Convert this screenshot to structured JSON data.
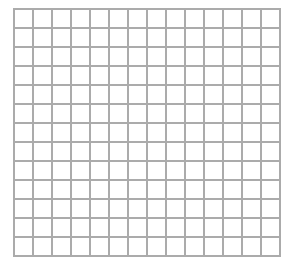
{
  "grid": {
    "columns": 14,
    "rows": 13,
    "cell_size_px": 19,
    "line_color": "#ababab",
    "background": "#ffffff"
  }
}
